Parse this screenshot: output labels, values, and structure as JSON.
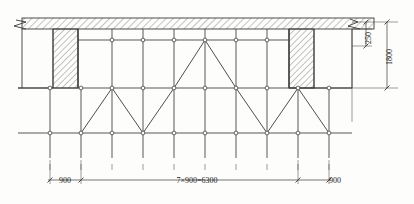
{
  "drawing": {
    "title": "scaffolding-elevation",
    "type": "engineering-elevation",
    "colors": {
      "line": "#3a3a3a",
      "hatch": "#555555",
      "background": "#fdfdfc",
      "node_fill": "#ffffff"
    }
  },
  "dimensions": {
    "bottom": [
      {
        "label": "900",
        "value": 900,
        "span": "left-cantilever"
      },
      {
        "label": "7×900=6300",
        "value": 6300,
        "span": "main-bays"
      },
      {
        "label": "900",
        "value": 900,
        "span": "right-cantilever"
      }
    ],
    "right": [
      {
        "label": "250",
        "value": 250,
        "span": "slab-thickness"
      },
      {
        "label": "1800",
        "value": 1800,
        "span": "storey-height"
      }
    ]
  },
  "structure": {
    "bay_count": 7,
    "bay_width": 900,
    "total_width": 6300,
    "posts": 10,
    "ledger_rows": 3,
    "hatched_regions": [
      "top-slab-band",
      "left-wall-pier",
      "right-wall-pier"
    ],
    "break_symbols": [
      "left-top",
      "right-top"
    ],
    "node_symbol": "circle-joint"
  },
  "geometry": {
    "slab": {
      "x": 22,
      "y": 18,
      "w": 352,
      "h": 11
    },
    "piers": [
      {
        "name": "left-pier",
        "x": 53,
        "y": 29,
        "w": 25,
        "h": 59
      },
      {
        "name": "right-pier",
        "x": 289,
        "y": 29,
        "w": 25,
        "h": 59
      }
    ],
    "rows_y": [
      40,
      88,
      133
    ],
    "post_x": [
      50,
      81,
      112,
      143,
      174,
      205,
      236,
      267,
      298,
      329
    ],
    "top_row_x": [
      112,
      143,
      174,
      205,
      236,
      267
    ],
    "post_bottom": 158,
    "ledger_left": 18,
    "ledger_right": 352
  }
}
